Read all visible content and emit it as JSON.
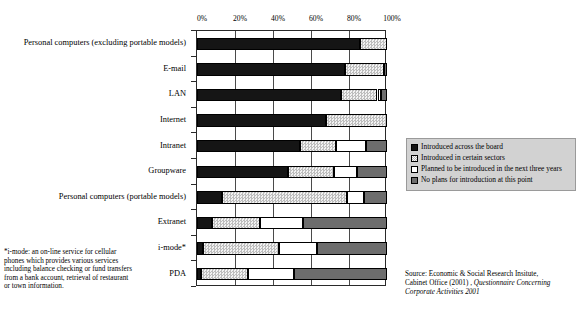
{
  "chart_data": {
    "type": "bar",
    "orientation": "horizontal",
    "stacked": true,
    "stack_mode": "percent",
    "title": "",
    "xlabel": "",
    "ylabel": "",
    "xlim": [
      0,
      100
    ],
    "xticks": [
      "0%",
      "20%",
      "40%",
      "60%",
      "80%",
      "100%"
    ],
    "xtick_values": [
      0,
      20,
      40,
      60,
      80,
      100
    ],
    "grid": true,
    "legend_position": "right",
    "categories": [
      "Personal computers (excluding portable models)",
      "E-mail",
      "LAN",
      "Internet",
      "Intranet",
      "Groupware",
      "Personal computers (portable models)",
      "Extranet",
      "i-mode*",
      "PDA"
    ],
    "series": [
      {
        "name": "Introduced across the board",
        "pattern": "solid-black",
        "color": "#151515",
        "values": [
          86,
          78,
          76,
          68,
          54,
          48,
          13,
          8,
          3,
          2
        ]
      },
      {
        "name": "Introduced in certain sectors",
        "pattern": "light-dotted",
        "color": "#d9d9d9",
        "values": [
          14,
          20.5,
          19,
          32,
          19,
          24,
          66,
          25,
          40,
          25
        ]
      },
      {
        "name": "Planned to be introduced in the next three years",
        "pattern": "white",
        "color": "#ffffff",
        "values": [
          0,
          0,
          2,
          0,
          16,
          12,
          9,
          23,
          20,
          24
        ]
      },
      {
        "name": "No plans for introduction at this point",
        "pattern": "mid-gray",
        "color": "#6d6d6d",
        "values": [
          0,
          1.5,
          3,
          0,
          11,
          16,
          12,
          44,
          37,
          49
        ]
      }
    ]
  },
  "legend": {
    "items": [
      "Introduced across the board",
      "Introduced in certain sectors",
      "Planned to be introduced in the next three years",
      "No plans for introduction at this point"
    ]
  },
  "footnote": {
    "text": "*i-mode: an on-line service for cellular phones which provides various services including balance checking or fund transfers from a bank account, retrieval of restaurant or town information."
  },
  "source": {
    "line1": "Source: Economic & Social Research Insitute,",
    "line2": "Cabinet Office (2001) , ",
    "line2_italic": "Questionnaire Concerning",
    "line3_italic": "Corporate Activities 2001"
  }
}
